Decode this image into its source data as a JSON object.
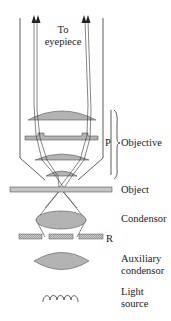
{
  "labels": {
    "eyepiece_line1": "To",
    "eyepiece_line2": "eyepiece",
    "p": "P",
    "objective": "Objective",
    "object": "Object",
    "condensor": "Condensor",
    "r": "R",
    "auxiliary_line1": "Auxiliary",
    "auxiliary_line2": "condensor",
    "light_line1": "Light",
    "light_line2": "source"
  },
  "colors": {
    "lens_fill": "#b3b3b3",
    "line": "#333333",
    "stage_fill": "#c4c4c4",
    "background": "#ffffff"
  }
}
